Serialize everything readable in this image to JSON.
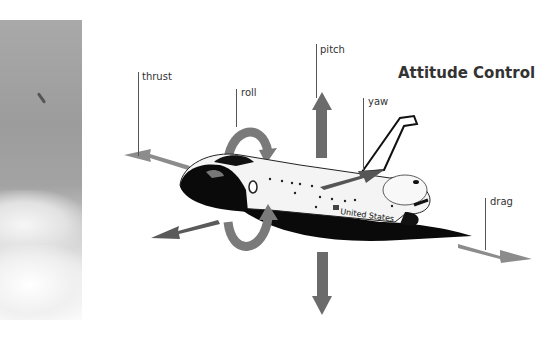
{
  "title": "Attitude Control",
  "labels": {
    "thrust": "thrust",
    "roll": "roll",
    "pitch": "pitch",
    "yaw": "yaw",
    "drag": "drag"
  },
  "shuttle": {
    "fuselage_text": "United States"
  },
  "colors": {
    "arrow": "#6b6b6b",
    "arrow_light": "#8c8c8c",
    "text": "#333333",
    "background": "#ffffff"
  }
}
